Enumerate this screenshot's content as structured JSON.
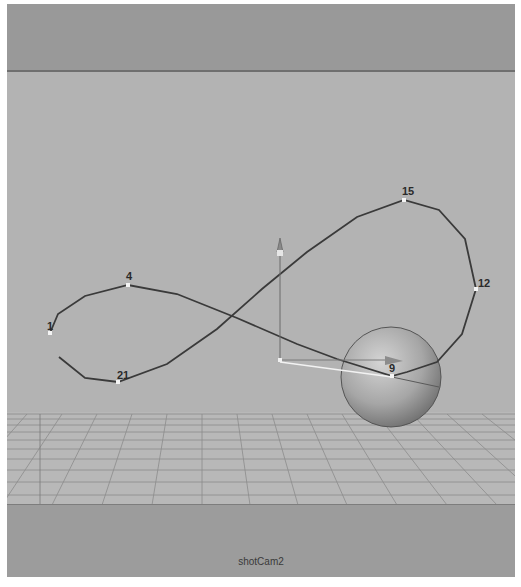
{
  "viewport": {
    "camera_name": "shotCam2",
    "colors": {
      "background": "#b3b3b3",
      "gate": "#999999",
      "curve": "#3a3a3a",
      "grid": "#8a8a8a",
      "sphere": "#a8a8a8"
    }
  },
  "curve": {
    "name": "motion-path-figure-eight",
    "control_points": [
      {
        "label": "1",
        "x": 43,
        "y": 329
      },
      {
        "label": "4",
        "x": 121,
        "y": 281
      },
      {
        "label": "15",
        "x": 397,
        "y": 196
      },
      {
        "label": "12",
        "x": 469,
        "y": 285
      },
      {
        "label": "9",
        "x": 385,
        "y": 372
      },
      {
        "label": "21",
        "x": 111,
        "y": 378
      }
    ]
  },
  "objects": {
    "sphere": {
      "label": "sphere",
      "cx": 384,
      "cy": 373,
      "r": 50
    },
    "locator": {
      "label": "move-manipulator",
      "x": 273,
      "y": 356
    }
  }
}
